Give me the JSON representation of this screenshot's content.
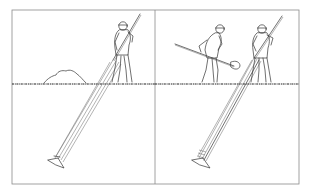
{
  "figure": {
    "panels": [
      {
        "id": "left",
        "description": "Worker driving a long pipe/probe diagonally into the ground; dirt pile on surface",
        "elements": [
          "worker-with-pole",
          "dirt-pile",
          "ground-line",
          "diagonal-pipe",
          "pipe-tip"
        ]
      },
      {
        "id": "right",
        "description": "Worker shoveling beside a second worker driving the pipe diagonally into the ground",
        "elements": [
          "worker-with-shovel",
          "worker-with-pole",
          "ground-line",
          "diagonal-pipe",
          "pipe-tip"
        ]
      }
    ],
    "colors": {
      "ink": "#333333",
      "frame": "#8a8a8a",
      "background": "#ffffff"
    }
  }
}
